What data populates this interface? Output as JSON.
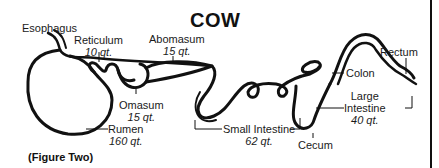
{
  "title": "COW",
  "caption": "(Figure Two)",
  "labels": {
    "esophagus": {
      "name": "Esophagus"
    },
    "reticulum": {
      "name": "Reticulum",
      "qty": "10 qt."
    },
    "abomasum": {
      "name": "Abomasum",
      "qty": "15 qt."
    },
    "omasum": {
      "name": "Omasum",
      "qty": "15 qt."
    },
    "rumen": {
      "name": "Rumen",
      "qty": "160 qt."
    },
    "small_intestine": {
      "name": "Small Intestine",
      "qty": "62 qt."
    },
    "cecum": {
      "name": "Cecum"
    },
    "colon": {
      "name": "Colon"
    },
    "rectum": {
      "name": "Rectum"
    },
    "large_intestine": {
      "name_line1": "Large",
      "name_line2": "Intestine",
      "qty": "40 qt."
    }
  }
}
